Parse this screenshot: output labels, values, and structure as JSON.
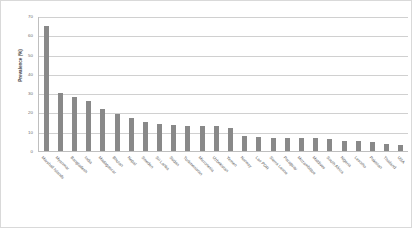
{
  "chart_data": {
    "type": "bar",
    "title": "",
    "xlabel": "",
    "ylabel": "Prevalence (%)",
    "ylim": [
      0,
      70
    ],
    "yticks": [
      0,
      10,
      20,
      30,
      40,
      50,
      60,
      70
    ],
    "grid": true,
    "legend": false,
    "bar_color": "#898989",
    "categories": [
      "Marshall Islands",
      "Myanmar",
      "Bangladesh",
      "India",
      "Madagascar",
      "Bhutan",
      "Nepal",
      "Sweden",
      "Sri Lanka",
      "Sudan",
      "Turkmenistan",
      "Micronesia",
      "Uzbekistan",
      "Yemen",
      "Norway",
      "Lao PDR",
      "Sierra Leone",
      "Paraguay",
      "Mozambique",
      "Maldives",
      "South Africa",
      "Nigeria",
      "Lesotho",
      "Pakistan",
      "Thailand",
      "USA"
    ],
    "values": [
      65,
      30,
      28,
      26,
      22,
      19,
      17,
      15,
      14,
      13.5,
      13,
      13,
      13,
      12,
      8,
      7.5,
      7,
      7,
      7,
      7,
      6,
      5,
      5,
      4.5,
      3.5,
      3
    ]
  }
}
